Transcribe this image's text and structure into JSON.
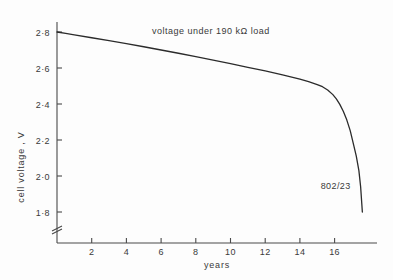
{
  "chart_data": {
    "type": "line",
    "title": "voltage  under  190 kΩ  load",
    "xlabel": "years",
    "ylabel": "cell voltage , V",
    "xlim": [
      0,
      18.4
    ],
    "ylim": [
      1.7,
      2.86
    ],
    "grid": false,
    "legend": "none",
    "xticks": [
      2,
      4,
      6,
      8,
      10,
      12,
      14,
      16
    ],
    "xtick_labels": [
      "2",
      "4",
      "6",
      "8",
      "10",
      "12",
      "14",
      "16"
    ],
    "yticks": [
      1.8,
      2.0,
      2.2,
      2.4,
      2.6,
      2.8
    ],
    "ytick_labels": [
      "1·8",
      "2·0",
      "2·2",
      "2·4",
      "2·6",
      "2·8"
    ],
    "axis_break": {
      "axis": "y",
      "symbol": "zigzag",
      "note": "y axis broken below 1·8"
    },
    "annotations": [
      {
        "text": "802/23",
        "x": 15.2,
        "y": 1.93
      }
    ],
    "series": [
      {
        "name": "802/23",
        "color": "#2b2b2b",
        "x": [
          0.0,
          0.5,
          1.0,
          2.0,
          3.0,
          4.0,
          5.0,
          6.0,
          7.0,
          8.0,
          9.0,
          10.0,
          11.0,
          12.0,
          13.0,
          14.0,
          14.5,
          15.0,
          15.3,
          15.6,
          15.9,
          16.1,
          16.3,
          16.5,
          16.7,
          16.9,
          17.1,
          17.25,
          17.4,
          17.5,
          17.6
        ],
        "y": [
          2.8,
          2.792,
          2.784,
          2.768,
          2.752,
          2.735,
          2.718,
          2.7,
          2.682,
          2.663,
          2.644,
          2.624,
          2.604,
          2.584,
          2.562,
          2.538,
          2.524,
          2.508,
          2.496,
          2.478,
          2.452,
          2.428,
          2.398,
          2.36,
          2.312,
          2.252,
          2.172,
          2.11,
          2.03,
          1.94,
          1.8
        ]
      }
    ]
  },
  "layout": {
    "plot_left_px": 57,
    "plot_bottom_px": 243,
    "x_per_year_px": 17.35,
    "y_per_volt_px": 180
  }
}
